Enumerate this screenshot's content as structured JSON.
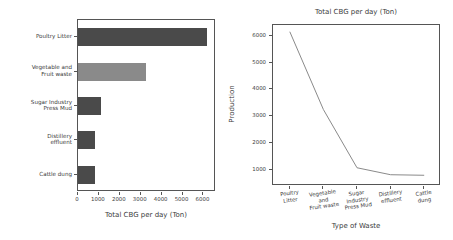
{
  "chart_data": [
    {
      "type": "bar",
      "orientation": "horizontal",
      "title": "",
      "xlabel": "Total CBG per day (Ton)",
      "ylabel": "Type of Waste",
      "categories": [
        "Poultry Litter",
        "Vegetable and Fruit waste",
        "Sugar Industry Press Mud",
        "Distillery effluent",
        "Cattle dung"
      ],
      "category_lines": [
        [
          "Poultry Litter"
        ],
        [
          "Vegetable and",
          "Fruit waste"
        ],
        [
          "Sugar Industry",
          "Press Mud"
        ],
        [
          "Distillery",
          "effluent"
        ],
        [
          "Cattle dung"
        ]
      ],
      "values": [
        6150,
        3250,
        1080,
        820,
        800
      ],
      "bar_colors": [
        "#4a4a4a",
        "#8a8a8a",
        "#4a4a4a",
        "#4a4a4a",
        "#4a4a4a"
      ],
      "xlim": [
        0,
        6600
      ],
      "xticks": [
        0,
        1000,
        2000,
        3000,
        4000,
        5000,
        6000
      ],
      "xtick_labels": [
        "0",
        "1000",
        "2000",
        "3000",
        "4000",
        "5000",
        "6000"
      ],
      "grid": false,
      "legend": "none"
    },
    {
      "type": "line",
      "title": "Total CBG per day (Ton)",
      "xlabel": "Type of Waste",
      "ylabel": "Production",
      "categories": [
        "Poultry Litter",
        "Vegetable and Fruit waste",
        "Sugar Industry Press Mud",
        "Distillery effluent",
        "Cattle dung"
      ],
      "category_lines": [
        [
          "Poultry",
          "Litter"
        ],
        [
          "Vegetable",
          "and",
          "Fruit waste"
        ],
        [
          "Sugar",
          "Industry",
          "Press Mud"
        ],
        [
          "Distillery",
          "effluent"
        ],
        [
          "Cattle",
          "dung"
        ]
      ],
      "values": [
        6150,
        3250,
        1080,
        820,
        800
      ],
      "line_color": "#8a8a8a",
      "ylim": [
        400,
        6400
      ],
      "yticks": [
        1000,
        2000,
        3000,
        4000,
        5000,
        6000
      ],
      "ytick_labels": [
        "1000",
        "2000",
        "3000",
        "4000",
        "5000",
        "6000"
      ],
      "grid": false,
      "legend": "none"
    }
  ]
}
